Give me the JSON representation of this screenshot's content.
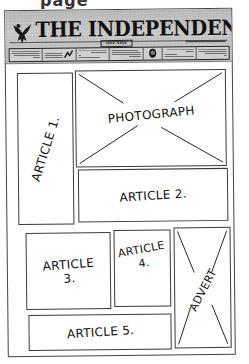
{
  "fragment": {
    "text": "page"
  },
  "masthead": {
    "title": "THE INDEPENDENT",
    "price_box": "ONE NINE",
    "logo": "eagle-logo",
    "teasers": [
      {
        "type": "text"
      },
      {
        "type": "image-scribble"
      },
      {
        "type": "text"
      },
      {
        "type": "text"
      },
      {
        "type": "image-round"
      },
      {
        "type": "text"
      },
      {
        "type": "text"
      }
    ],
    "background_color": "#c2c2c2"
  },
  "layout": {
    "article_1": {
      "label_line1": "ARTICLE 1."
    },
    "photograph": {
      "label": "PHOTOGRAPH"
    },
    "article_2": {
      "label": "ARTICLE 2."
    },
    "article_3": {
      "label_line1": "ARTICLE",
      "label_line2": "3."
    },
    "article_4": {
      "label_line1": "ARTICLE",
      "label_line2": "4."
    },
    "advert": {
      "label": "ADVERT"
    },
    "article_5": {
      "label": "ARTICLE 5."
    }
  },
  "colors": {
    "line": "#3a3a3a",
    "paper": "#ffffff",
    "ink": "#111111"
  }
}
